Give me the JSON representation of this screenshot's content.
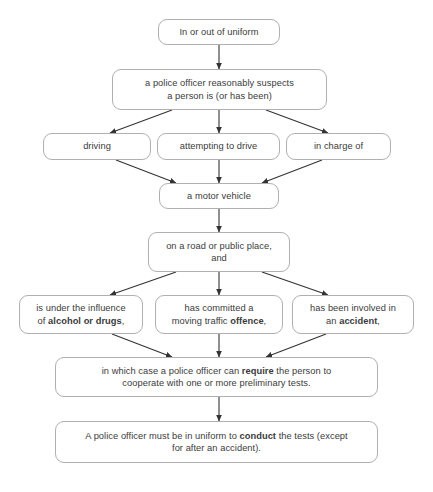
{
  "diagram": {
    "colors": {
      "border": "#b0b0b0",
      "text": "#3b3b3b",
      "arrow": "#333333",
      "background": "#ffffff"
    },
    "nodes": [
      {
        "id": "uniform",
        "text": "In or out of uniform",
        "html": "In or out of uniform"
      },
      {
        "id": "suspects",
        "text": "a police officer reasonably suspects a person is (or has been)",
        "html": "a police officer reasonably suspects<br>a person is (or has been)"
      },
      {
        "id": "driving",
        "text": "driving",
        "html": "driving"
      },
      {
        "id": "attempting",
        "text": "attempting to drive",
        "html": "attempting to drive"
      },
      {
        "id": "in-charge",
        "text": "in charge of",
        "html": "in charge of"
      },
      {
        "id": "motor-vehicle",
        "text": "a motor vehicle",
        "html": "a motor vehicle"
      },
      {
        "id": "road-public-place",
        "text": "on a road or public place, and",
        "html": "on a road or public place,<br>and"
      },
      {
        "id": "influence",
        "text": "is under the influence of alcohol or drugs,",
        "html": "is under the influence<br>of <b>alcohol or drugs</b>,"
      },
      {
        "id": "offence",
        "text": "has committed a moving traffic offence,",
        "html": "has committed a<br>moving traffic <b>offence</b>,"
      },
      {
        "id": "accident",
        "text": "has been involved in an accident,",
        "html": "has been involved in<br>an <b>accident</b>,"
      },
      {
        "id": "require-tests",
        "text": "in which case a police officer can require the person to cooperate with one or more preliminary tests.",
        "html": "in which case a police officer can <b>require</b> the person to<br>cooperate with one or more preliminary tests."
      },
      {
        "id": "conduct-tests",
        "text": "A police officer must be in uniform to conduct the tests (except for after an accident).",
        "html": "A police officer must be in uniform to <b>conduct</b> the tests (except<br>for after an accident)."
      }
    ],
    "footer_cut_text": ""
  }
}
